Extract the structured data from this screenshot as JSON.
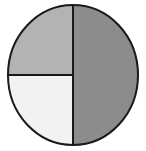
{
  "diagram": {
    "shape": "circle",
    "background_color": "#ffffff",
    "outline_color": "#1a1a1a",
    "outline_width": 2,
    "divider_color": "#1a1a1a",
    "divider_width": 2,
    "center": {
      "x": 73,
      "y": 75
    },
    "radius": {
      "x": 65,
      "y": 70
    },
    "segments": [
      {
        "name": "right-half",
        "label": "Right half",
        "fraction": "1/2",
        "percent": 50,
        "fill": "#8c8c8c",
        "shade": "dark gray",
        "start_angle": -90,
        "end_angle": 90
      },
      {
        "name": "upper-left-quadrant",
        "label": "Upper left quarter",
        "fraction": "1/4",
        "percent": 25,
        "fill": "#b3b3b3",
        "shade": "light gray",
        "start_angle": 180,
        "end_angle": 270
      },
      {
        "name": "lower-left-quadrant",
        "label": "Lower left quarter",
        "fraction": "1/4",
        "percent": 25,
        "fill": "#f2f2f2",
        "shade": "white",
        "start_angle": 90,
        "end_angle": 180
      }
    ],
    "dividers": [
      {
        "name": "vertical-divider",
        "orientation": "vertical",
        "x1": 73,
        "y1": 5,
        "x2": 73,
        "y2": 145
      },
      {
        "name": "horizontal-divider-left",
        "orientation": "horizontal",
        "x1": 8,
        "y1": 75,
        "x2": 73,
        "y2": 75
      }
    ]
  }
}
